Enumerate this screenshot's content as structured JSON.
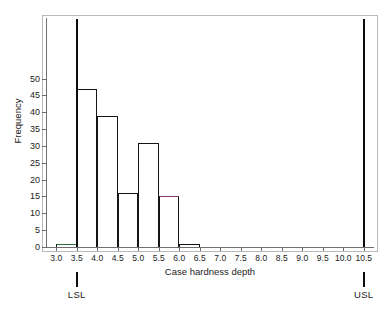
{
  "chart_data": {
    "type": "bar",
    "title": "",
    "subtitle": "",
    "xlabel": "Case hardness depth",
    "ylabel": "Frequency",
    "grid": false,
    "legend": "none",
    "bin_width": 0.5,
    "xlim": [
      2.75,
      10.75
    ],
    "ylim": [
      0,
      68
    ],
    "categories": [
      "3.0",
      "3.5",
      "4.0",
      "4.5",
      "5.0",
      "5.5",
      "6.0"
    ],
    "bin_starts": [
      3.0,
      3.5,
      4.0,
      4.5,
      5.0,
      5.5,
      6.0
    ],
    "bin_ends": [
      3.5,
      4.0,
      4.5,
      5.0,
      5.5,
      6.0,
      6.5
    ],
    "values": [
      1,
      47,
      39,
      16,
      31,
      15,
      1
    ],
    "bar_colors": [
      "#2f6b3e",
      "#151515",
      "#151515",
      "#151515",
      "#151515",
      "#8b3a7a",
      "#151515"
    ],
    "xticks": [
      "3.0",
      "3.5",
      "4.0",
      "4.5",
      "5.0",
      "5.5",
      "6.0",
      "6.5",
      "7.0",
      "7.5",
      "8.0",
      "8.5",
      "9.0",
      "9.5",
      "10.0",
      "10.5"
    ],
    "xtick_values": [
      3.0,
      3.5,
      4.0,
      4.5,
      5.0,
      5.5,
      6.0,
      6.5,
      7.0,
      7.5,
      8.0,
      8.5,
      9.0,
      9.5,
      10.0,
      10.5
    ],
    "yticks": [
      "0",
      "5",
      "10",
      "15",
      "20",
      "25",
      "30",
      "35",
      "40",
      "45",
      "50"
    ],
    "ytick_values": [
      0,
      5,
      10,
      15,
      20,
      25,
      30,
      35,
      40,
      45,
      50
    ],
    "annotations": [
      {
        "name": "LSL",
        "label": "LSL",
        "value": 3.5,
        "color": "#0d0d0d"
      },
      {
        "name": "USL",
        "label": "USL",
        "value": 10.5,
        "color": "#0d0d0d"
      }
    ],
    "colors": {
      "axis": "#6e6e72",
      "frame": "#b9b9bc",
      "bar_outline": "#151515",
      "spec_line": "#0d0d0d",
      "background": "#ffffff",
      "text": "#1c1c1c"
    }
  }
}
